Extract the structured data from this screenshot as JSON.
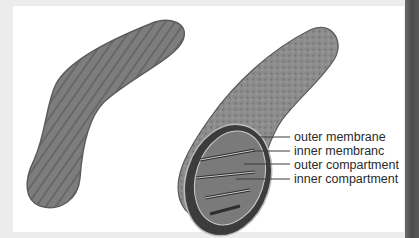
{
  "figure": {
    "left_image": "micrograph-mitochondrion",
    "right_image": "cutaway-mitochondrion-illustration",
    "labels": [
      {
        "text": "outer membrane"
      },
      {
        "text": "inner membranc"
      },
      {
        "text": "outer compartment"
      },
      {
        "text": "inner compartment"
      }
    ]
  },
  "colors": {
    "background": "#ececec",
    "panel": "#ffffff",
    "micrograph": "#7d7d7d",
    "illustration": "#8a8a8a",
    "label_text": "#2a2a2a"
  }
}
